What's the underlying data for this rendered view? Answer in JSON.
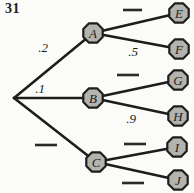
{
  "problem_number": "31",
  "colors": {
    "line": "#1d1d1b",
    "node_fill": "#b5b3ae",
    "node_stroke": "#1d1d1b",
    "background": "#fbfbf9"
  },
  "diagram": {
    "type": "probability-tree",
    "root_branches": [
      {
        "node": "A",
        "probability": ".2",
        "blank": false
      },
      {
        "node": "B",
        "probability": ".1",
        "blank": false
      },
      {
        "node": "C",
        "probability": "",
        "blank": true
      }
    ],
    "leaf_branches": [
      {
        "from": "A",
        "node": "E",
        "probability": "",
        "blank": true
      },
      {
        "from": "A",
        "node": "F",
        "probability": ".5",
        "blank": false
      },
      {
        "from": "B",
        "node": "G",
        "probability": "",
        "blank": true
      },
      {
        "from": "B",
        "node": "H",
        "probability": ".9",
        "blank": false
      },
      {
        "from": "C",
        "node": "I",
        "probability": "",
        "blank": true
      },
      {
        "from": "C",
        "node": "J",
        "probability": "",
        "blank": true
      }
    ]
  }
}
